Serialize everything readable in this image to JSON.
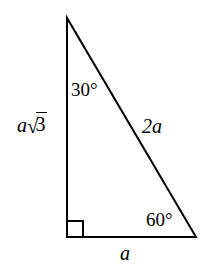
{
  "figure": {
    "background_color": "#ffffff",
    "stroke_color": "#000000",
    "stroke_width": 2,
    "vertices": {
      "apex": {
        "x": 67,
        "y": 18
      },
      "bottom_left": {
        "x": 67,
        "y": 237
      },
      "bottom_right": {
        "x": 196,
        "y": 237
      }
    },
    "right_angle_marker": {
      "corner": "bottom_left",
      "size": 16
    },
    "labels": {
      "angle_top": "30°",
      "angle_bottom_right": "60°",
      "side_left_coefficient": "a",
      "side_left_radical_sign": "√",
      "side_left_radicand": "3",
      "side_hypotenuse": "2a",
      "side_bottom": "a"
    }
  }
}
